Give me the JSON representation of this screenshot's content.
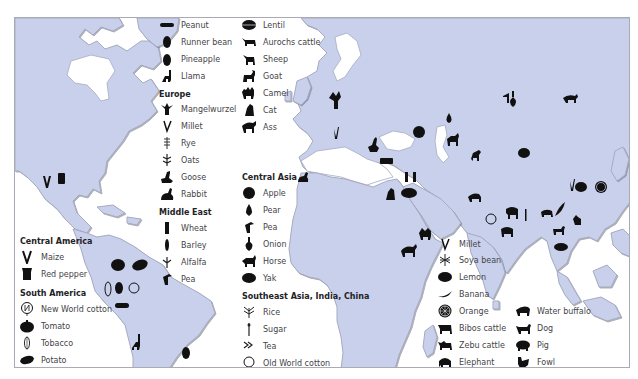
{
  "map": {
    "land_color": "#c9d0eb",
    "sea_color": "#ffffff",
    "symbol_color": "#111111",
    "border_color": "#a9aab4"
  },
  "legend": {
    "americas_top": {
      "items": [
        {
          "label": "Peanut",
          "icon": "peanut-icon"
        },
        {
          "label": "Runner bean",
          "icon": "runner-bean-icon"
        },
        {
          "label": "Pineapple",
          "icon": "pineapple-icon"
        },
        {
          "label": "Llama",
          "icon": "llama-icon"
        }
      ]
    },
    "europe": {
      "heading": "Europe",
      "items": [
        {
          "label": "Mangelwurzel",
          "icon": "mangelwurzel-icon"
        },
        {
          "label": "Millet",
          "icon": "millet-icon"
        },
        {
          "label": "Rye",
          "icon": "rye-icon"
        },
        {
          "label": "Oats",
          "icon": "oats-icon"
        },
        {
          "label": "Goose",
          "icon": "goose-icon"
        },
        {
          "label": "Rabbit",
          "icon": "rabbit-icon"
        }
      ]
    },
    "middle_east": {
      "heading": "Middle East",
      "items": [
        {
          "label": "Wheat",
          "icon": "wheat-icon"
        },
        {
          "label": "Barley",
          "icon": "barley-icon"
        },
        {
          "label": "Alfalfa",
          "icon": "alfalfa-icon"
        },
        {
          "label": "Pea",
          "icon": "pea-icon"
        }
      ]
    },
    "middle_east_cont": {
      "items": [
        {
          "label": "Lentil",
          "icon": "lentil-icon"
        },
        {
          "label": "Aurochs cattle",
          "icon": "aurochs-cattle-icon"
        },
        {
          "label": "Sheep",
          "icon": "sheep-icon"
        },
        {
          "label": "Goat",
          "icon": "goat-icon"
        },
        {
          "label": "Camel",
          "icon": "camel-icon"
        },
        {
          "label": "Cat",
          "icon": "cat-icon"
        },
        {
          "label": "Ass",
          "icon": "ass-icon"
        }
      ]
    },
    "central_asia": {
      "heading": "Central Asia",
      "items": [
        {
          "label": "Apple",
          "icon": "apple-icon"
        },
        {
          "label": "Pear",
          "icon": "pear-icon"
        },
        {
          "label": "Pea",
          "icon": "pea-icon"
        },
        {
          "label": "Onion",
          "icon": "onion-icon"
        },
        {
          "label": "Horse",
          "icon": "horse-icon"
        },
        {
          "label": "Yak",
          "icon": "yak-icon"
        }
      ]
    },
    "southeast_asia": {
      "heading": "Southeast Asia, India, China",
      "items": [
        {
          "label": "Rice",
          "icon": "rice-icon"
        },
        {
          "label": "Sugar",
          "icon": "sugar-icon"
        },
        {
          "label": "Tea",
          "icon": "tea-icon"
        },
        {
          "label": "Old World cotton",
          "icon": "old-world-cotton-icon"
        }
      ]
    },
    "southeast_asia_col2": {
      "items": [
        {
          "label": "Millet",
          "icon": "millet-icon"
        },
        {
          "label": "Soya bean",
          "icon": "soya-bean-icon"
        },
        {
          "label": "Lemon",
          "icon": "lemon-icon"
        },
        {
          "label": "Banana",
          "icon": "banana-icon"
        },
        {
          "label": "Orange",
          "icon": "orange-icon"
        },
        {
          "label": "Bibos cattle",
          "icon": "bibos-cattle-icon"
        },
        {
          "label": "Zebu cattle",
          "icon": "zebu-cattle-icon"
        },
        {
          "label": "Elephant",
          "icon": "elephant-icon"
        }
      ]
    },
    "southeast_asia_col3": {
      "items": [
        {
          "label": "Water buffalo",
          "icon": "water-buffalo-icon"
        },
        {
          "label": "Dog",
          "icon": "dog-icon"
        },
        {
          "label": "Pig",
          "icon": "pig-icon"
        },
        {
          "label": "Fowl",
          "icon": "fowl-icon"
        }
      ]
    },
    "central_america": {
      "heading": "Central America",
      "items": [
        {
          "label": "Maize",
          "icon": "maize-icon"
        },
        {
          "label": "Red pepper",
          "icon": "red-pepper-icon"
        }
      ]
    },
    "south_america": {
      "heading": "South America",
      "items": [
        {
          "label": "New World cotton",
          "icon": "new-world-cotton-icon"
        },
        {
          "label": "Tomato",
          "icon": "tomato-icon"
        },
        {
          "label": "Tobacco",
          "icon": "tobacco-icon"
        },
        {
          "label": "Potato",
          "icon": "potato-icon"
        }
      ]
    }
  }
}
